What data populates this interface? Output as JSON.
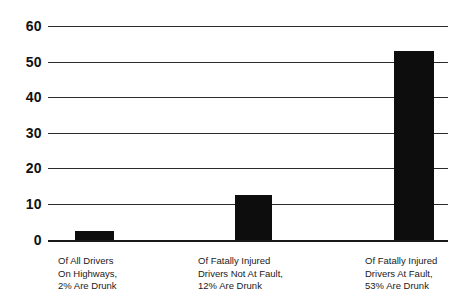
{
  "chart_data": {
    "type": "bar",
    "title": "",
    "subtitle": "",
    "xlabel": "",
    "ylabel": "",
    "ylim": [
      0,
      60
    ],
    "yticks": [
      0,
      10,
      20,
      30,
      40,
      50,
      60
    ],
    "grid": true,
    "legend": false,
    "legend_position": "none",
    "bar_color": "#0d0d0d",
    "grid_color": "#2b2b2b",
    "background": "#ffffff",
    "categories": [
      "Of All Drivers On Highways, 2% Are Drunk",
      "Of Fatally Injured Drivers Not At Fault, 12% Are Drunk",
      "Of Fatally Injured Drivers At Fault, 53% Are Drunk"
    ],
    "values": [
      2.5,
      12.5,
      53
    ],
    "labels_stated": [
      "2%",
      "12%",
      "53%"
    ],
    "category_lines": [
      [
        "Of All Drivers",
        "On Highways,",
        "2% Are Drunk"
      ],
      [
        "Of Fatally Injured",
        "Drivers Not At Fault,",
        "12% Are Drunk"
      ],
      [
        "Of Fatally Injured",
        "Drivers At Fault,",
        "53% Are Drunk"
      ]
    ]
  },
  "axis": {
    "y_tick_labels": [
      "60",
      "50",
      "40",
      "30",
      "20",
      "10",
      "0"
    ]
  }
}
